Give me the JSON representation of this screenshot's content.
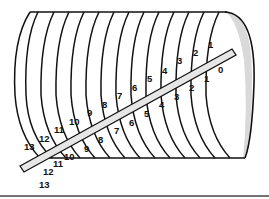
{
  "diagram": {
    "type": "cylinder-coil-with-rod",
    "upper_labels": [
      "1",
      "2",
      "3",
      "4",
      "5",
      "6",
      "7",
      "8",
      "9",
      "10",
      "11",
      "12",
      "13"
    ],
    "lower_labels": [
      "0",
      "1",
      "2",
      "3",
      "4",
      "5",
      "6",
      "7",
      "8",
      "9",
      "10",
      "11",
      "12",
      "13"
    ],
    "colors": {
      "stroke": "#111111",
      "end_cap": "#d9d9d9",
      "rod": "#e6e6e6",
      "background": "#ffffff"
    }
  }
}
